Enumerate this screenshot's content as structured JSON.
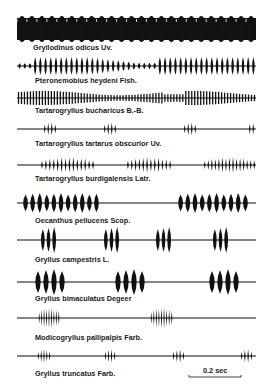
{
  "figure": {
    "type": "oscillogram-comparison",
    "ink_color": "#111111",
    "background": "#ffffff"
  },
  "rows": [
    {
      "species": "Gryllodinus odicus Uv.",
      "pattern": "continuous-dense",
      "center_y": 29,
      "amp": 13,
      "x0": 17,
      "x1": 256,
      "label_x": 33,
      "label_y": 43
    },
    {
      "species": "Pteronemobius heydeni Fish.",
      "pattern": "trill-modulated",
      "center_y": 66,
      "amp": 9,
      "x0": 17,
      "x1": 256,
      "label_x": 35,
      "label_y": 76
    },
    {
      "species": "Tartarogryllus bucharicus B.-B.",
      "pattern": "trill-fine",
      "center_y": 98,
      "amp": 7,
      "x0": 17,
      "x1": 256,
      "label_x": 35,
      "label_y": 106
    },
    {
      "species": "Tartarogryllus tartarus obscurior Uv.",
      "pattern": "chirps",
      "center_y": 129,
      "amp": 7,
      "x0": 17,
      "x1": 256,
      "label_x": 35,
      "label_y": 139,
      "chirps": [
        {
          "x": 43,
          "w": 14,
          "n": 4
        },
        {
          "x": 103,
          "w": 14,
          "n": 4
        },
        {
          "x": 183,
          "w": 14,
          "n": 4
        },
        {
          "x": 248,
          "w": 7,
          "n": 2
        }
      ]
    },
    {
      "species": "Tartarogryllus burdigalensis Latr.",
      "pattern": "mixed-chirps",
      "center_y": 165,
      "amp": 8,
      "x0": 17,
      "x1": 256,
      "label_x": 35,
      "label_y": 174,
      "chirps": [
        {
          "x": 40,
          "w": 55,
          "n": 14
        },
        {
          "x": 126,
          "w": 46,
          "n": 12
        },
        {
          "x": 203,
          "w": 53,
          "n": 15
        }
      ]
    },
    {
      "species": "Oecanthus pellucens Scop.",
      "pattern": "long-echemes",
      "center_y": 203,
      "amp": 10,
      "x0": 17,
      "x1": 256,
      "label_x": 35,
      "label_y": 216,
      "chirps": [
        {
          "x": 22,
          "w": 78,
          "n": 11,
          "fat": true
        },
        {
          "x": 177,
          "w": 72,
          "n": 10,
          "fat": true
        }
      ]
    },
    {
      "species": "Gryllus campestris L.",
      "pattern": "chirps-3",
      "center_y": 240,
      "amp": 13,
      "x0": 17,
      "x1": 256,
      "label_x": 35,
      "label_y": 255,
      "chirps": [
        {
          "x": 40,
          "w": 17,
          "n": 3,
          "fat": true
        },
        {
          "x": 103,
          "w": 17,
          "n": 3,
          "fat": true
        },
        {
          "x": 155,
          "w": 17,
          "n": 3,
          "fat": true
        },
        {
          "x": 212,
          "w": 17,
          "n": 3,
          "fat": true
        }
      ]
    },
    {
      "species": "Gryllus bimaculatus Degeer",
      "pattern": "chirps-4",
      "center_y": 282,
      "amp": 13,
      "x0": 17,
      "x1": 256,
      "label_x": 35,
      "label_y": 294,
      "chirps": [
        {
          "x": 34,
          "w": 32,
          "n": 4,
          "fat": true
        },
        {
          "x": 114,
          "w": 32,
          "n": 4,
          "fat": true
        },
        {
          "x": 208,
          "w": 32,
          "n": 4,
          "fat": true
        }
      ]
    },
    {
      "species": "Modicogryllus pallipalpis Farb.",
      "pattern": "short-chirps",
      "center_y": 318,
      "amp": 11,
      "x0": 17,
      "x1": 256,
      "label_x": 35,
      "label_y": 333,
      "chirps": [
        {
          "x": 38,
          "w": 22,
          "n": 9
        },
        {
          "x": 150,
          "w": 23,
          "n": 9
        }
      ]
    },
    {
      "species": "Gryllus truncatus Farb.",
      "pattern": "short-chirps-4",
      "center_y": 356,
      "amp": 7,
      "x0": 17,
      "x1": 256,
      "label_x": 35,
      "label_y": 369,
      "chirps": [
        {
          "x": 37,
          "w": 14,
          "n": 5
        },
        {
          "x": 104,
          "w": 12,
          "n": 4
        },
        {
          "x": 172,
          "w": 13,
          "n": 4
        },
        {
          "x": 240,
          "w": 13,
          "n": 4
        }
      ]
    }
  ],
  "scale_bar": {
    "label": "0.2 sec",
    "x0": 189,
    "x1": 241,
    "y": 377,
    "label_x": 203,
    "label_y": 366
  }
}
